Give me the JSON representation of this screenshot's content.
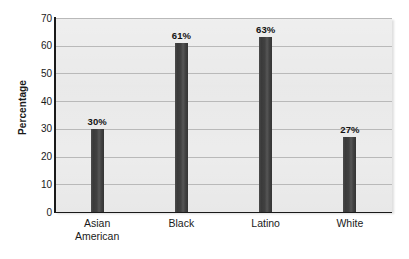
{
  "chart_data": {
    "type": "bar",
    "title": "",
    "subtitle": "",
    "xlabel": "",
    "ylabel": "Percentage",
    "categories": [
      "Asian\nAmerican",
      "Black",
      "Latino",
      "White"
    ],
    "values": [
      30,
      61,
      63,
      27
    ],
    "data_labels": [
      "30%",
      "61%",
      "63%",
      "27%"
    ],
    "ylim": [
      0,
      70
    ],
    "y_ticks": [
      0,
      10,
      20,
      30,
      40,
      50,
      60,
      70
    ],
    "y_tick_labels": [
      "0",
      "10",
      "20",
      "30",
      "40",
      "50",
      "60",
      "70"
    ],
    "grid": true,
    "grid_axis": "y",
    "legend": false,
    "legend_position": "none",
    "colors": {
      "bar": "#3e3e3e",
      "bar_highlight": "#565656",
      "plot_background": "#e7e7e7",
      "gridline": "#b9b9b9",
      "axis": "#1a1a1a",
      "text": "#1a1a1a",
      "page_background": "#ffffff"
    }
  }
}
